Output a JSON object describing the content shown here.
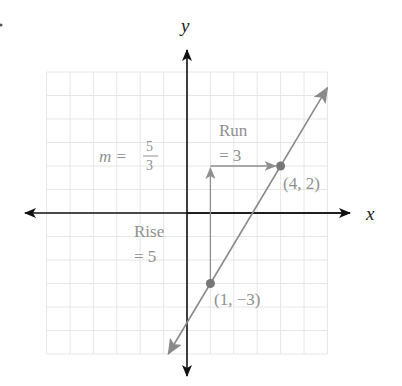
{
  "figure": {
    "axis_labels": {
      "x": "x",
      "y": "y"
    },
    "slope_label": {
      "prefix": "m =",
      "numerator": "5",
      "denominator": "3"
    },
    "run_label": {
      "line1": "Run",
      "line2": "= 3"
    },
    "rise_label": {
      "line1": "Rise",
      "line2": "= 5"
    },
    "points": [
      {
        "label": "(4, 2)",
        "x": 4,
        "y": 2
      },
      {
        "label": "(1, −3)",
        "x": 1,
        "y": -3
      }
    ],
    "run": {
      "from": [
        1,
        2
      ],
      "to": [
        4,
        2
      ],
      "value": 3
    },
    "rise": {
      "from": [
        1,
        -3
      ],
      "to": [
        1,
        2
      ],
      "value": 5
    },
    "line": {
      "slope": "5/3",
      "through": [
        [
          1,
          -3
        ],
        [
          4,
          2
        ]
      ]
    },
    "grid": {
      "xmin": -6,
      "xmax": 6,
      "ymin": -6,
      "ymax": 6,
      "step": 1
    },
    "colors": {
      "axis": "#111111",
      "line": "#8a8a8a",
      "annotation": "#8f8f8f",
      "grid": "#e6e6e6",
      "point": "#777777"
    }
  }
}
